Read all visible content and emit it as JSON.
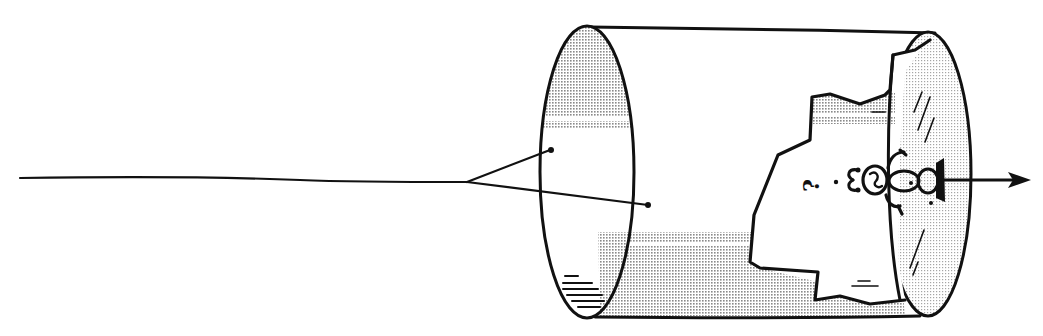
{
  "illustration": {
    "description": "Line drawing of a can-and-string telephone: a string runs from the left into a tin can; the can's side is torn open showing a small ant standing on the inside of the can's end with a question mark near its head; the string continues out the far end as an arrow.",
    "annotation_glyph": "?",
    "colors": {
      "ink": "#111111",
      "paper": "#ffffff",
      "shade_dark": "#bdbdbd",
      "shade_light": "#dcdcdc",
      "highlight": "#ffffff"
    },
    "string": {
      "start": [
        20,
        178
      ],
      "fork": [
        467,
        182
      ]
    },
    "arrow": {
      "start": [
        940,
        180
      ],
      "end": [
        1030,
        180
      ]
    }
  }
}
